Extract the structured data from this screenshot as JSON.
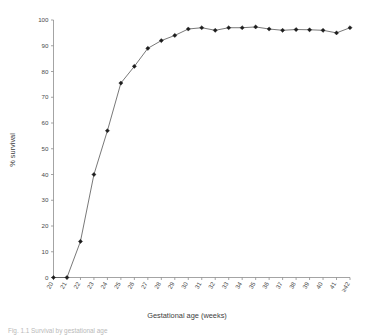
{
  "chart_data": {
    "type": "line",
    "title": "",
    "xlabel": "Gestational age (weeks)",
    "ylabel": "% survival",
    "categories": [
      "20",
      "21",
      "22",
      "23",
      "24",
      "25",
      "26",
      "27",
      "28",
      "29",
      "30",
      "31",
      "32",
      "33",
      "34",
      "35",
      "36",
      "37",
      "38",
      "39",
      "40",
      "41",
      "≥42"
    ],
    "values": [
      0,
      0,
      14,
      40,
      57,
      75.5,
      82,
      89,
      92,
      94,
      96.5,
      97,
      96,
      97,
      97,
      97.3,
      96.5,
      96,
      96.3,
      96.2,
      96,
      95,
      97
    ],
    "xlim": [
      0,
      22
    ],
    "ylim": [
      0,
      100
    ],
    "ytick_labels": [
      "0",
      "10",
      "20",
      "30",
      "40",
      "50",
      "60",
      "70",
      "80",
      "90",
      "100"
    ],
    "ytick_values": [
      0,
      10,
      20,
      30,
      40,
      50,
      60,
      70,
      80,
      90,
      100
    ],
    "grid": false,
    "legend": "none",
    "marker": "diamond",
    "series_color": "#555555",
    "marker_color": "#1d1d1d",
    "axis_color": "#8d8d8d"
  },
  "caption": {
    "text": "Fig. 1.1  Survival by gestational age"
  }
}
